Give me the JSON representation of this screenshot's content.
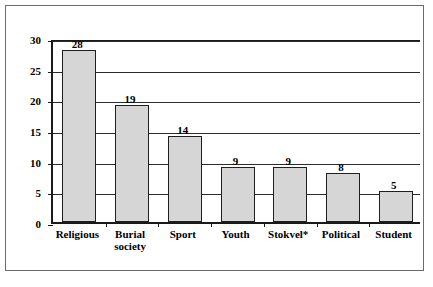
{
  "chart_data": {
    "type": "bar",
    "title": "",
    "subtitle": "",
    "xlabel": "",
    "ylabel": "",
    "categories": [
      "Religious",
      "Burial society",
      "Sport",
      "Youth",
      "Stokvel*",
      "Political",
      "Student"
    ],
    "values": [
      28,
      19,
      14,
      9,
      9,
      8,
      5
    ],
    "value_labels": [
      "28",
      "19",
      "14",
      "9",
      "9",
      "8",
      "5"
    ],
    "ylim": [
      0,
      30
    ],
    "yticks": [
      0,
      5,
      10,
      15,
      20,
      25,
      30
    ],
    "ytick_labels": [
      "0",
      "5",
      "10",
      "15",
      "20",
      "25",
      "30"
    ],
    "grid": true,
    "grid_axis": "y",
    "legend": false,
    "legend_position": "none",
    "bar_fill": "#d6d6d6",
    "bar_edge": "#1f1f1f",
    "axis_color": "#1a1a1a",
    "frame_color": "#6b6b6b",
    "background": "#ffffff"
  },
  "figure": {
    "footnote": ""
  }
}
